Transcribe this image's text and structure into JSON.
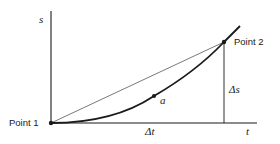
{
  "diagram": {
    "type": "position-time graph",
    "axes": {
      "y_label": "s",
      "x_label": "t"
    },
    "points": [
      {
        "id": "point1",
        "label": "Point 1",
        "x": 51,
        "y": 123
      },
      {
        "id": "a",
        "label": "a",
        "x": 154,
        "y": 96
      },
      {
        "id": "point2",
        "label": "Point 2",
        "x": 224,
        "y": 42
      }
    ],
    "intervals": {
      "delta_t": "Δt",
      "delta_s": "Δs"
    },
    "elements": [
      "curved trajectory from Point 1 through a to Point 2 and beyond",
      "straight secant line from Point 1 to Point 2",
      "vertical segment from Point 2 down to t-axis (Δs)",
      "horizontal t-axis segment (Δt)"
    ],
    "colors": {
      "line": "#1a1a1a",
      "secant": "#555555",
      "background": "#ffffff"
    }
  }
}
